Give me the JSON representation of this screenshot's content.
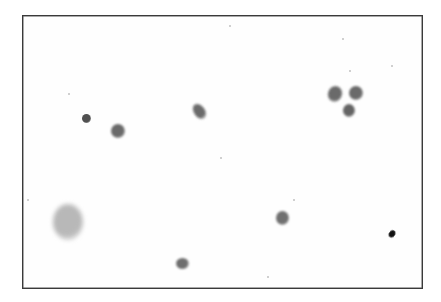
{
  "image": {
    "description": "Grayscale micrograph of scattered stained cells on a light background within a thin dark frame",
    "colors": {
      "background": "#fefefe",
      "frame": "#3a3a3a",
      "cell_mid": "#6e6e6e",
      "cell_dark": "#3c3c3c",
      "debris": "#111111",
      "smudge": "#b0b0b0"
    }
  },
  "cells": [
    {
      "name": "small-dark-round-cell",
      "x": 86,
      "y": 118,
      "w": 9,
      "h": 9,
      "color": "#505050",
      "blur": 0.6,
      "rot": 0
    },
    {
      "name": "round-cell",
      "x": 118,
      "y": 131,
      "w": 14,
      "h": 14,
      "color": "#6a6a6a",
      "blur": 0.9,
      "rot": 0
    },
    {
      "name": "elongated-cell",
      "x": 199,
      "y": 111,
      "w": 11,
      "h": 17,
      "color": "#6a6a6a",
      "blur": 0.9,
      "rot": -35
    },
    {
      "name": "cluster-cell-left",
      "x": 335,
      "y": 94,
      "w": 14,
      "h": 16,
      "color": "#6a6a6a",
      "blur": 0.9,
      "rot": 20
    },
    {
      "name": "cluster-cell-right",
      "x": 356,
      "y": 93,
      "w": 14,
      "h": 14,
      "color": "#6a6a6a",
      "blur": 0.9,
      "rot": 0
    },
    {
      "name": "cluster-cell-bottom",
      "x": 349,
      "y": 110,
      "w": 12,
      "h": 13,
      "color": "#646464",
      "blur": 0.9,
      "rot": 0
    },
    {
      "name": "lobed-cell-lower-right",
      "x": 282,
      "y": 218,
      "w": 13,
      "h": 14,
      "color": "#707070",
      "blur": 0.9,
      "rot": 0
    },
    {
      "name": "crescent-cell-bottom",
      "x": 182,
      "y": 263,
      "w": 13,
      "h": 11,
      "color": "#6e6e6e",
      "blur": 0.8,
      "rot": 0
    },
    {
      "name": "dark-debris-particle",
      "x": 392,
      "y": 234,
      "w": 6,
      "h": 8,
      "color": "#111111",
      "blur": 0.3,
      "rot": 35
    },
    {
      "name": "faint-smudge",
      "x": 68,
      "y": 222,
      "w": 30,
      "h": 36,
      "color": "#b8b8b8",
      "blur": 2.2,
      "rot": 0
    }
  ],
  "specks": [
    {
      "x": 229,
      "y": 25
    },
    {
      "x": 342,
      "y": 38
    },
    {
      "x": 349,
      "y": 70
    },
    {
      "x": 68,
      "y": 93
    },
    {
      "x": 220,
      "y": 157
    },
    {
      "x": 293,
      "y": 199
    },
    {
      "x": 27,
      "y": 199
    },
    {
      "x": 267,
      "y": 276
    },
    {
      "x": 391,
      "y": 65
    }
  ]
}
